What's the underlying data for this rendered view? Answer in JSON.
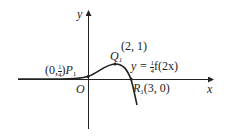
{
  "diagram": {
    "axes": {
      "x_label": "x",
      "y_label": "y",
      "origin_label": "O"
    },
    "points": [
      {
        "name": "P",
        "subscript": "1",
        "coord_text": "(0, 1/4)",
        "coord_prefix": "(0,",
        "frac_num": "1",
        "frac_den": "4",
        "coord_suffix": ")"
      },
      {
        "name": "Q",
        "subscript": "1",
        "coord_text": "(2, 1)"
      },
      {
        "name": "R",
        "subscript": "1",
        "coord_text": "(3, 0)"
      }
    ],
    "curve_label": {
      "prefix": "y = ",
      "frac_num": "1",
      "frac_den": "4",
      "suffix": "f(2x)"
    },
    "colors": {
      "stroke": "#222222",
      "background": "#ffffff"
    }
  }
}
